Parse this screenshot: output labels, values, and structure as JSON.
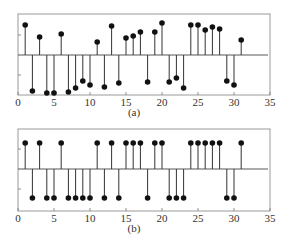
{
  "chart_data": [
    {
      "type": "stem",
      "label": "(a)",
      "xlim": [
        0,
        35
      ],
      "xticks": [
        0,
        5,
        10,
        15,
        20,
        25,
        30,
        35
      ],
      "yticks": [
        -1,
        1
      ],
      "ylim": [
        -2.0,
        2.0
      ],
      "grid": false,
      "x": [
        1,
        2,
        3,
        4,
        5,
        6,
        7,
        8,
        9,
        10,
        11,
        12,
        13,
        14,
        15,
        16,
        17,
        18,
        19,
        20,
        21,
        22,
        23,
        24,
        25,
        26,
        27,
        28,
        29,
        30,
        31
      ],
      "values": [
        1.5,
        -1.8,
        0.9,
        -1.9,
        -1.9,
        1.05,
        -1.85,
        -1.65,
        -1.3,
        -1.5,
        0.65,
        -1.6,
        1.45,
        -1.4,
        0.85,
        0.95,
        1.15,
        -1.35,
        1.15,
        1.6,
        -1.35,
        -1.15,
        -1.65,
        1.5,
        1.5,
        1.25,
        1.4,
        1.3,
        -1.3,
        -1.5,
        0.75
      ]
    },
    {
      "type": "stem",
      "label": "(b)",
      "xlim": [
        0,
        35
      ],
      "xticks": [
        0,
        5,
        10,
        15,
        20,
        25,
        30,
        35
      ],
      "yticks": [
        -1,
        1
      ],
      "ylim": [
        -2.0,
        2.0
      ],
      "grid": false,
      "x": [
        1,
        2,
        3,
        4,
        5,
        6,
        7,
        8,
        9,
        10,
        11,
        12,
        13,
        14,
        15,
        16,
        17,
        18,
        19,
        20,
        21,
        22,
        23,
        24,
        25,
        26,
        27,
        28,
        29,
        30,
        31
      ],
      "values": [
        1.3,
        -1.45,
        1.3,
        -1.45,
        -1.45,
        1.3,
        -1.45,
        -1.45,
        -1.45,
        -1.45,
        1.3,
        -1.45,
        1.3,
        -1.45,
        1.3,
        1.3,
        1.3,
        -1.45,
        1.3,
        1.3,
        -1.45,
        -1.45,
        -1.45,
        1.3,
        1.3,
        1.3,
        1.3,
        1.3,
        -1.45,
        -1.45,
        1.3
      ]
    }
  ],
  "panels": [
    {
      "label": "(a)",
      "top": 14,
      "bottom": 95,
      "zero": 55
    },
    {
      "label": "(b)",
      "top": 129,
      "bottom": 211,
      "zero": 169
    }
  ]
}
